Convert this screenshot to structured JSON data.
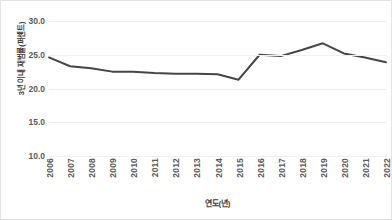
{
  "chart_data": {
    "type": "line",
    "title": "",
    "subtitle": "",
    "xlabel": "연도(년)",
    "ylabel": "3년 이내 재범률(퍼센트)",
    "categories": [
      "2006",
      "2007",
      "2008",
      "2009",
      "2010",
      "2011",
      "2012",
      "2013",
      "2014",
      "2015",
      "2016",
      "2017",
      "2018",
      "2019",
      "2020",
      "2021",
      "2022"
    ],
    "series": [
      {
        "name": "3년 이내 재범률",
        "color": "#454545",
        "values": [
          24.6,
          23.3,
          23.0,
          22.5,
          22.5,
          22.3,
          22.2,
          22.2,
          22.1,
          21.3,
          25.0,
          24.8,
          25.7,
          26.7,
          25.2,
          24.6,
          23.9
        ]
      }
    ],
    "ylim": [
      10.0,
      30.0
    ],
    "ytick_values": [
      30.0,
      25.0,
      20.0,
      15.0,
      10.0
    ],
    "ytick_labels": [
      "30.0",
      "25.0",
      "20.0",
      "15.0",
      "10.0"
    ],
    "xtick_labels": [
      "2006",
      "2007",
      "2008",
      "2009",
      "2010",
      "2011",
      "2012",
      "2013",
      "2014",
      "2015",
      "2016",
      "2017",
      "2018",
      "2019",
      "2020",
      "2021",
      "2022"
    ],
    "grid": true,
    "grid_axis": "y",
    "grid_color": "#efefef",
    "legend": false,
    "legend_position": "none",
    "markers": false,
    "line_width": 2,
    "background_color": "#ffffff",
    "border_color": "#e3e3e3",
    "tick_label_color": "#5a5a5a",
    "axis_title_color": "#3c3c3c",
    "xtick_rotation": 90
  }
}
